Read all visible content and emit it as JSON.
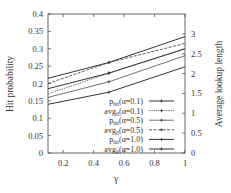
{
  "chart_data": {
    "type": "line",
    "title": "",
    "xlabel": "γ",
    "ylabel": "Hit probability",
    "y2label": "Average lookup length",
    "xlim": [
      0.1,
      1.0
    ],
    "ylim": [
      0,
      0.4
    ],
    "y2lim": [
      0,
      3.5
    ],
    "x_ticks": [
      "0.2",
      "0.4",
      "0.6",
      "0.8",
      "1"
    ],
    "y_ticks": [
      "0",
      "0.05",
      "0.1",
      "0.15",
      "0.2",
      "0.25",
      "0.3",
      "0.35",
      "0.4"
    ],
    "y2_ticks": [
      "0",
      "0.5",
      "1",
      "1.5",
      "2",
      "2.5",
      "3"
    ],
    "grid": false,
    "legend_position": "lower right",
    "x": [
      0.1,
      0.5,
      1.0
    ],
    "series": [
      {
        "name": "p_hit(α=0.1)",
        "axis": "left",
        "style": "solid",
        "values": [
          0.14,
          0.175,
          0.248
        ]
      },
      {
        "name": "avg_ll(α=0.1)",
        "axis": "right",
        "style": "dotted",
        "values": [
          1.49,
          2.01,
          2.63
        ]
      },
      {
        "name": "p_hit(α=0.5)",
        "axis": "left",
        "style": "solid-thin",
        "values": [
          0.16,
          0.205,
          0.28
        ]
      },
      {
        "name": "avg_ll(α=0.5)",
        "axis": "right",
        "style": "dashed",
        "values": [
          1.75,
          2.28,
          2.76
        ]
      },
      {
        "name": "p_hit(α=1.0)",
        "axis": "left",
        "style": "solid",
        "values": [
          0.185,
          0.23,
          0.3
        ]
      },
      {
        "name": "avg_ll(α=1.0)",
        "axis": "right",
        "style": "solid",
        "values": [
          1.88,
          2.28,
          2.93
        ]
      }
    ]
  },
  "legend": {
    "items": [
      {
        "main": "p",
        "sub": "hit",
        "rest": "(α=0.1)"
      },
      {
        "main": "avg",
        "sub": "ll",
        "rest": "(α=0.1)"
      },
      {
        "main": "p",
        "sub": "hit",
        "rest": "(α=0.5)"
      },
      {
        "main": "avg",
        "sub": "ll",
        "rest": "(α=0.5)"
      },
      {
        "main": "p",
        "sub": "hit",
        "rest": "(α=1.0)"
      },
      {
        "main": "avg",
        "sub": "ll",
        "rest": "(α=1.0)"
      }
    ]
  },
  "axes": {
    "x_title": "γ",
    "y_title": "Hit probability",
    "y2_title": "Average lookup length"
  },
  "colors": {
    "line": "#333333",
    "axis": "#444444"
  }
}
